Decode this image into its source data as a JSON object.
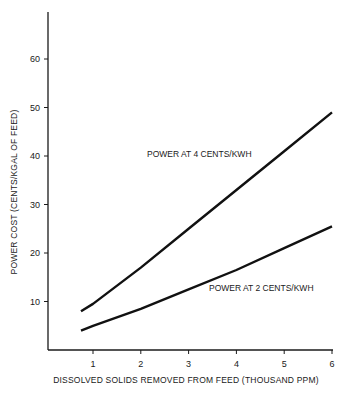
{
  "chart_data": {
    "type": "line",
    "title": "",
    "xlabel": "DISSOLVED SOLIDS REMOVED FROM FEED (THOUSAND PPM)",
    "ylabel": "POWER COST (CENTS/KGAL OF FEED)",
    "x_ticks": [
      "1",
      "2",
      "3",
      "4",
      "5",
      "6"
    ],
    "y_ticks": [
      "10",
      "20",
      "30",
      "40",
      "50",
      "60"
    ],
    "xlim": [
      0.25,
      6
    ],
    "ylim": [
      0,
      70
    ],
    "grid": false,
    "legend": "inline labels",
    "series": [
      {
        "name": "POWER AT 4 CENTS/KWH",
        "x": [
          0.75,
          1,
          2,
          3,
          4,
          5,
          6
        ],
        "y": [
          8,
          9.5,
          17,
          25,
          33,
          41,
          49
        ]
      },
      {
        "name": "POWER AT 2 CENTS/KWH",
        "x": [
          0.75,
          1,
          2,
          3,
          4,
          5,
          6
        ],
        "y": [
          4,
          5,
          8.5,
          12.5,
          16.5,
          21,
          25.5
        ]
      }
    ]
  }
}
